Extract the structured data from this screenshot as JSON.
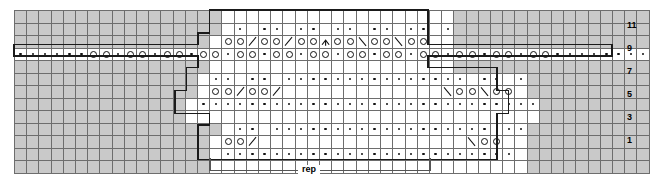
{
  "chart_data": {
    "type": "table",
    "title": "",
    "columns": 52,
    "rows": 12,
    "row_labels_visible": [
      "11",
      "9",
      "7",
      "5",
      "3",
      "1"
    ],
    "legend_symbols": [
      {
        "name": "purl-dot",
        "glyph": "·",
        "meaning": "purl"
      },
      {
        "name": "yarn-over",
        "glyph": "O",
        "meaning": "yarn over"
      },
      {
        "name": "k2tog",
        "glyph": "/",
        "meaning": "knit 2 together"
      },
      {
        "name": "ssk",
        "glyph": "\\",
        "meaning": "slip slip knit"
      },
      {
        "name": "central-double-decrease",
        "glyph": "∧",
        "meaning": "central double decrease"
      },
      {
        "name": "no-stitch",
        "glyph": "",
        "meaning": "no stitch (grey)"
      }
    ],
    "colors": {
      "no_stitch": "#c9c9c9",
      "stitch": "#ffffff",
      "grid_line": "#6d6d6d",
      "heavy_outline": "#1a1a1a",
      "text": "#000000",
      "rep_line": "#555555"
    },
    "rep": {
      "label": "rep",
      "start_col": 17,
      "end_col": 36
    },
    "cells": [
      [
        "x",
        "x",
        "x",
        "x",
        "x",
        "x",
        "x",
        "x",
        "x",
        "x",
        "x",
        "x",
        "x",
        "x",
        "x",
        "x",
        "x",
        "e",
        "e",
        "e",
        "e",
        "e",
        "e",
        "e",
        "e",
        "e",
        "e",
        "e",
        "e",
        "e",
        "e",
        "e",
        "e",
        "e",
        "e",
        "e",
        "x",
        "x",
        "x",
        "x",
        "x",
        "x",
        "x",
        "x",
        "x",
        "x",
        "x",
        "x",
        "x",
        "x",
        "x",
        "x"
      ],
      [
        "x",
        "x",
        "x",
        "x",
        "x",
        "x",
        "x",
        "x",
        "x",
        "x",
        "x",
        "x",
        "x",
        "x",
        "x",
        "x",
        "x",
        "e",
        "d",
        "e",
        "d",
        "d",
        "e",
        "d",
        "d",
        "e",
        "d",
        "d",
        "e",
        "d",
        "d",
        "e",
        "d",
        "d",
        "e",
        "d",
        "x",
        "x",
        "x",
        "x",
        "x",
        "x",
        "x",
        "x",
        "x",
        "x",
        "x",
        "x",
        "x",
        "x",
        "x",
        "x"
      ],
      [
        "x",
        "x",
        "x",
        "x",
        "x",
        "x",
        "x",
        "x",
        "x",
        "x",
        "x",
        "x",
        "x",
        "x",
        "x",
        "x",
        "e",
        "o",
        "o",
        "k",
        "o",
        "o",
        "k",
        "o",
        "o",
        "c",
        "o",
        "o",
        "s",
        "o",
        "o",
        "s",
        "o",
        "o",
        "e",
        "e",
        "x",
        "x",
        "x",
        "x",
        "x",
        "x",
        "x",
        "x",
        "x",
        "x",
        "x",
        "x",
        "x",
        "x",
        "x",
        "x"
      ],
      [
        "d",
        "d",
        "d",
        "d",
        "d",
        "d",
        "o",
        "o",
        "d",
        "o",
        "o",
        "d",
        "o",
        "o",
        "d",
        "o",
        "o",
        "d",
        "o",
        "o",
        "d",
        "o",
        "o",
        "d",
        "o",
        "o",
        "d",
        "o",
        "o",
        "d",
        "o",
        "o",
        "d",
        "o",
        "o",
        "d",
        "o",
        "o",
        "d",
        "o",
        "o",
        "d",
        "o",
        "o",
        "d",
        "d",
        "d",
        "d",
        "d",
        "d",
        "d",
        "d"
      ],
      [
        "x",
        "x",
        "x",
        "x",
        "x",
        "x",
        "x",
        "x",
        "x",
        "x",
        "x",
        "x",
        "x",
        "x",
        "x",
        "x",
        "e",
        "e",
        "e",
        "e",
        "e",
        "e",
        "e",
        "e",
        "e",
        "e",
        "e",
        "e",
        "e",
        "e",
        "e",
        "e",
        "e",
        "e",
        "e",
        "e",
        "x",
        "x",
        "x",
        "x",
        "x",
        "x",
        "x",
        "x",
        "x",
        "x",
        "x",
        "x",
        "x",
        "x",
        "x",
        "x"
      ],
      [
        "x",
        "x",
        "x",
        "x",
        "x",
        "x",
        "x",
        "x",
        "x",
        "x",
        "x",
        "x",
        "x",
        "x",
        "x",
        "e",
        "d",
        "d",
        "e",
        "d",
        "d",
        "e",
        "d",
        "d",
        "d",
        "d",
        "d",
        "d",
        "d",
        "d",
        "d",
        "d",
        "d",
        "d",
        "d",
        "d",
        "d",
        "e",
        "d",
        "d",
        "e",
        "d",
        "x",
        "x",
        "x",
        "x",
        "x",
        "x",
        "x",
        "x",
        "x",
        "x"
      ],
      [
        "x",
        "x",
        "x",
        "x",
        "x",
        "x",
        "x",
        "x",
        "x",
        "x",
        "x",
        "x",
        "x",
        "x",
        "x",
        "e",
        "o",
        "o",
        "k",
        "o",
        "o",
        "k",
        "e",
        "e",
        "e",
        "e",
        "e",
        "e",
        "e",
        "e",
        "e",
        "e",
        "e",
        "e",
        "e",
        "s",
        "o",
        "o",
        "s",
        "o",
        "o",
        "e",
        "x",
        "x",
        "x",
        "x",
        "x",
        "x",
        "x",
        "x",
        "x",
        "x"
      ],
      [
        "x",
        "x",
        "x",
        "x",
        "x",
        "x",
        "x",
        "x",
        "x",
        "x",
        "x",
        "x",
        "x",
        "x",
        "e",
        "d",
        "d",
        "d",
        "d",
        "d",
        "d",
        "d",
        "d",
        "d",
        "d",
        "d",
        "d",
        "d",
        "d",
        "d",
        "d",
        "d",
        "d",
        "d",
        "d",
        "d",
        "d",
        "d",
        "d",
        "d",
        "d",
        "d",
        "d",
        "x",
        "x",
        "x",
        "x",
        "x",
        "x",
        "x",
        "x",
        "x"
      ],
      [
        "x",
        "x",
        "x",
        "x",
        "x",
        "x",
        "x",
        "x",
        "x",
        "x",
        "x",
        "x",
        "x",
        "x",
        "e",
        "e",
        "e",
        "e",
        "e",
        "e",
        "e",
        "e",
        "e",
        "e",
        "e",
        "e",
        "e",
        "e",
        "e",
        "e",
        "e",
        "e",
        "e",
        "e",
        "e",
        "e",
        "e",
        "e",
        "e",
        "e",
        "e",
        "e",
        "e",
        "x",
        "x",
        "x",
        "x",
        "x",
        "x",
        "x",
        "x",
        "x"
      ],
      [
        "x",
        "x",
        "x",
        "x",
        "x",
        "x",
        "x",
        "x",
        "x",
        "x",
        "x",
        "x",
        "x",
        "x",
        "x",
        "x",
        "x",
        "e",
        "d",
        "d",
        "e",
        "d",
        "d",
        "d",
        "d",
        "d",
        "d",
        "d",
        "d",
        "d",
        "d",
        "d",
        "d",
        "d",
        "d",
        "d",
        "d",
        "d",
        "d",
        "e",
        "d",
        "d",
        "x",
        "x",
        "x",
        "x",
        "x",
        "x",
        "x",
        "x",
        "x",
        "x"
      ],
      [
        "x",
        "x",
        "x",
        "x",
        "x",
        "x",
        "x",
        "x",
        "x",
        "x",
        "x",
        "x",
        "x",
        "x",
        "x",
        "x",
        "e",
        "o",
        "o",
        "k",
        "e",
        "e",
        "e",
        "e",
        "e",
        "e",
        "e",
        "e",
        "e",
        "e",
        "e",
        "e",
        "e",
        "e",
        "e",
        "e",
        "e",
        "s",
        "o",
        "o",
        "e",
        "e",
        "x",
        "x",
        "x",
        "x",
        "x",
        "x",
        "x",
        "x",
        "x",
        "x"
      ],
      [
        "x",
        "x",
        "x",
        "x",
        "x",
        "x",
        "x",
        "x",
        "x",
        "x",
        "x",
        "x",
        "x",
        "x",
        "x",
        "x",
        "e",
        "d",
        "d",
        "d",
        "d",
        "d",
        "d",
        "d",
        "d",
        "d",
        "d",
        "d",
        "d",
        "d",
        "d",
        "d",
        "d",
        "d",
        "d",
        "d",
        "d",
        "d",
        "d",
        "d",
        "d",
        "e",
        "x",
        "x",
        "x",
        "x",
        "x",
        "x",
        "x",
        "x",
        "x",
        "x"
      ],
      [
        "x",
        "x",
        "x",
        "x",
        "x",
        "x",
        "x",
        "x",
        "x",
        "x",
        "x",
        "x",
        "x",
        "x",
        "x",
        "x",
        "e",
        "e",
        "e",
        "e",
        "e",
        "e",
        "e",
        "e",
        "e",
        "e",
        "e",
        "e",
        "e",
        "e",
        "e",
        "e",
        "e",
        "e",
        "e",
        "e",
        "e",
        "e",
        "e",
        "e",
        "e",
        "e",
        "x",
        "x",
        "x",
        "x",
        "x",
        "x",
        "x",
        "x",
        "x",
        "x"
      ]
    ]
  },
  "row_labels": [
    {
      "text": "11",
      "top": 21
    },
    {
      "text": "9",
      "top": 44
    },
    {
      "text": "7",
      "top": 67
    },
    {
      "text": "5",
      "top": 90
    },
    {
      "text": "3",
      "top": 113
    },
    {
      "text": "1",
      "top": 136
    }
  ],
  "rep": {
    "label": "rep"
  }
}
